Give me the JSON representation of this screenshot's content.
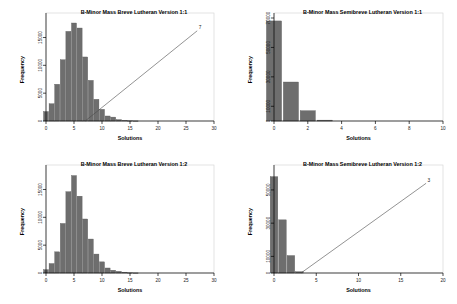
{
  "figure": {
    "panel_count": 4,
    "background": "#ffffff",
    "bar_color": "#6e6e6e",
    "line_color": "#4a4a4a"
  },
  "chart_data": [
    {
      "id": "top-left",
      "type": "bar",
      "title": "B-Minor Mass Breve Lutheran Version 1:1",
      "xlabel": "Solutions",
      "ylabel": "Frequency",
      "xlim": [
        0,
        30
      ],
      "ylim": [
        0,
        18500
      ],
      "xticks": [
        0,
        5,
        10,
        15,
        20,
        25,
        30
      ],
      "yticks": [
        0,
        5000,
        10000,
        15000
      ],
      "grid": false,
      "categories": [
        0,
        1,
        2,
        3,
        4,
        5,
        6,
        7,
        8,
        9,
        10,
        11,
        12,
        13,
        14,
        15,
        16
      ],
      "values": [
        1700,
        3100,
        6600,
        11000,
        16100,
        17600,
        16700,
        11500,
        7300,
        3900,
        2100,
        900,
        700,
        250,
        120,
        60,
        20
      ],
      "annotation": {
        "label": "7",
        "x": 27,
        "y": 16200,
        "line_from_x": 7,
        "line_from_y": 0
      }
    },
    {
      "id": "top-right",
      "type": "bar",
      "title": "B-Minor Mass Semibreve Lutheran Version 1:1",
      "xlabel": "Solutions",
      "ylabel": "Frequency",
      "xlim": [
        0,
        10
      ],
      "ylim": [
        0,
        70000
      ],
      "xticks": [
        0,
        2,
        4,
        6,
        8,
        10
      ],
      "yticks": [
        0,
        10000,
        30000,
        50000,
        70000
      ],
      "grid": false,
      "categories": [
        0,
        1,
        2,
        3
      ],
      "values": [
        68000,
        26500,
        7000,
        600
      ],
      "annotation": null
    },
    {
      "id": "bottom-left",
      "type": "bar",
      "title": "B-Minor Mass Breve Lutheran Version 1:2",
      "xlabel": "Solutions",
      "ylabel": "Frequency",
      "xlim": [
        0,
        30
      ],
      "ylim": [
        0,
        18500
      ],
      "xticks": [
        0,
        5,
        10,
        15,
        20,
        25,
        30
      ],
      "yticks": [
        0,
        5000,
        10000,
        15000
      ],
      "grid": false,
      "categories": [
        0,
        1,
        2,
        3,
        4,
        5,
        6,
        7,
        8,
        9,
        10,
        11,
        12,
        13,
        14,
        15,
        16
      ],
      "values": [
        600,
        1700,
        3800,
        8900,
        14600,
        17500,
        13800,
        9700,
        6100,
        3400,
        2000,
        900,
        500,
        300,
        150,
        60,
        20
      ],
      "annotation": null
    },
    {
      "id": "bottom-right",
      "type": "bar",
      "title": "B-Minor Mass Semibreve Lutheran Version 1:2",
      "xlabel": "Solutions",
      "ylabel": "Frequency",
      "xlim": [
        0,
        20
      ],
      "ylim": [
        0,
        62000
      ],
      "xticks": [
        0,
        5,
        10,
        15,
        20
      ],
      "yticks": [
        0,
        10000,
        30000,
        50000
      ],
      "grid": false,
      "categories": [
        0,
        1,
        2,
        3
      ],
      "values": [
        58000,
        32000,
        10500,
        800
      ],
      "annotation": {
        "label": "3",
        "x": 18,
        "y": 54000,
        "line_from_x": 3.2,
        "line_from_y": 0
      }
    }
  ]
}
